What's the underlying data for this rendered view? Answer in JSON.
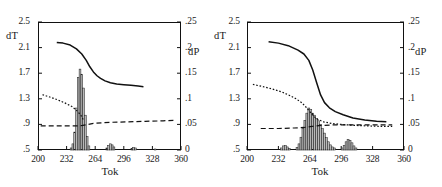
{
  "figure": {
    "panels": [
      {
        "id": "A",
        "tag": "(A)",
        "axis_left_label": "dT",
        "axis_right_label": "dP",
        "axis_x_label": "Tok"
      },
      {
        "id": "B",
        "tag": "(B)",
        "axis_left_label": "dT",
        "axis_right_label": "dP",
        "axis_x_label": "Tok"
      }
    ],
    "yticks_left": [
      "2.5",
      "2.1",
      "1.7",
      "1.3",
      ".9",
      ".5"
    ],
    "yticks_right": [
      ".25",
      ".2",
      ".15",
      ".1",
      ".05",
      "0"
    ],
    "xticks": [
      "200",
      "232",
      "264",
      "296",
      "328",
      "360"
    ]
  },
  "chart_data": [
    {
      "type": "line",
      "title": "(A)",
      "xlabel": "Tok",
      "ylabel": "dT",
      "y2label": "dP",
      "xlim": [
        200,
        360
      ],
      "ylim": [
        0.5,
        2.5
      ],
      "y2lim": [
        0,
        0.25
      ],
      "grid": false,
      "legend": "none",
      "xticks": [
        200,
        232,
        264,
        296,
        328,
        360
      ],
      "yticks": [
        0.5,
        0.9,
        1.3,
        1.7,
        2.1,
        2.5
      ],
      "y2ticks": [
        0,
        0.05,
        0.1,
        0.15,
        0.2,
        0.25
      ],
      "series": [
        {
          "name": "dT solid curve",
          "style": "solid",
          "axis": "left",
          "x": [
            221,
            228,
            236,
            243,
            249,
            254,
            258,
            262,
            266,
            270,
            275,
            281,
            288,
            296,
            304,
            312,
            318
          ],
          "y": [
            2.18,
            2.17,
            2.14,
            2.08,
            2.0,
            1.9,
            1.8,
            1.72,
            1.66,
            1.62,
            1.58,
            1.55,
            1.53,
            1.52,
            1.51,
            1.5,
            1.49
          ]
        },
        {
          "name": "dP dotted curve",
          "style": "dotted",
          "axis": "right",
          "x": [
            205,
            214,
            222,
            230,
            238,
            244,
            248,
            251
          ],
          "y": [
            0.108,
            0.103,
            0.098,
            0.092,
            0.085,
            0.076,
            0.068,
            0.058
          ]
        },
        {
          "name": "dP dashed baseline",
          "style": "dashed",
          "axis": "right",
          "x": [
            203,
            222,
            242,
            250,
            262,
            280,
            300,
            320,
            340,
            352
          ],
          "y": [
            0.047,
            0.047,
            0.047,
            0.048,
            0.052,
            0.054,
            0.055,
            0.056,
            0.057,
            0.058
          ]
        }
      ],
      "histogram": {
        "name": "dP histogram",
        "axis": "right",
        "bin_width": 2,
        "bins": [
          {
            "x": 237,
            "y": 0.004
          },
          {
            "x": 239,
            "y": 0.012
          },
          {
            "x": 241,
            "y": 0.035
          },
          {
            "x": 243,
            "y": 0.082
          },
          {
            "x": 245,
            "y": 0.142
          },
          {
            "x": 247,
            "y": 0.158
          },
          {
            "x": 249,
            "y": 0.148
          },
          {
            "x": 251,
            "y": 0.121
          },
          {
            "x": 253,
            "y": 0.068
          },
          {
            "x": 255,
            "y": 0.026
          },
          {
            "x": 257,
            "y": 0.008
          },
          {
            "x": 277,
            "y": 0.004
          },
          {
            "x": 279,
            "y": 0.009
          },
          {
            "x": 281,
            "y": 0.012
          },
          {
            "x": 283,
            "y": 0.01
          },
          {
            "x": 285,
            "y": 0.006
          },
          {
            "x": 305,
            "y": 0.003
          },
          {
            "x": 307,
            "y": 0.005
          },
          {
            "x": 309,
            "y": 0.004
          },
          {
            "x": 331,
            "y": 0.002
          }
        ]
      }
    },
    {
      "type": "line",
      "title": "(B)",
      "xlabel": "Tok",
      "ylabel": "dT",
      "y2label": "dP",
      "xlim": [
        200,
        360
      ],
      "ylim": [
        0.5,
        2.5
      ],
      "y2lim": [
        0,
        0.25
      ],
      "grid": false,
      "legend": "none",
      "xticks": [
        200,
        232,
        264,
        296,
        328,
        360
      ],
      "yticks": [
        0.5,
        0.9,
        1.3,
        1.7,
        2.1,
        2.5
      ],
      "y2ticks": [
        0,
        0.05,
        0.1,
        0.15,
        0.2,
        0.25
      ],
      "series": [
        {
          "name": "dT solid curve",
          "style": "solid",
          "axis": "left",
          "x": [
            222,
            232,
            242,
            252,
            258,
            263,
            267,
            271,
            275,
            279,
            284,
            290,
            298,
            308,
            320,
            332,
            342
          ],
          "y": [
            2.19,
            2.17,
            2.13,
            2.06,
            2.0,
            1.9,
            1.75,
            1.55,
            1.36,
            1.24,
            1.16,
            1.1,
            1.05,
            1.0,
            0.97,
            0.95,
            0.94
          ]
        },
        {
          "name": "dP dotted curve",
          "style": "dotted",
          "axis": "right",
          "x": [
            206,
            216,
            226,
            236,
            244,
            250,
            256,
            260,
            264,
            268,
            272,
            278,
            286,
            296,
            310,
            324,
            338,
            348
          ],
          "y": [
            0.128,
            0.124,
            0.119,
            0.113,
            0.106,
            0.1,
            0.092,
            0.084,
            0.075,
            0.066,
            0.06,
            0.055,
            0.052,
            0.05,
            0.048,
            0.047,
            0.046,
            0.046
          ]
        },
        {
          "name": "dP dashed baseline",
          "style": "dashed",
          "axis": "right",
          "x": [
            214,
            232,
            248,
            258,
            266,
            276,
            288,
            300,
            316,
            334,
            348
          ],
          "y": [
            0.042,
            0.042,
            0.043,
            0.044,
            0.046,
            0.048,
            0.049,
            0.049,
            0.049,
            0.049,
            0.049
          ]
        }
      ],
      "histogram": {
        "name": "dP histogram",
        "axis": "right",
        "bin_width": 2,
        "bins": [
          {
            "x": 235,
            "y": 0.004
          },
          {
            "x": 237,
            "y": 0.008
          },
          {
            "x": 239,
            "y": 0.009
          },
          {
            "x": 241,
            "y": 0.006
          },
          {
            "x": 243,
            "y": 0.003
          },
          {
            "x": 251,
            "y": 0.005
          },
          {
            "x": 253,
            "y": 0.012
          },
          {
            "x": 255,
            "y": 0.025
          },
          {
            "x": 257,
            "y": 0.042
          },
          {
            "x": 259,
            "y": 0.058
          },
          {
            "x": 261,
            "y": 0.072
          },
          {
            "x": 263,
            "y": 0.082
          },
          {
            "x": 265,
            "y": 0.079
          },
          {
            "x": 267,
            "y": 0.072
          },
          {
            "x": 269,
            "y": 0.068
          },
          {
            "x": 271,
            "y": 0.062
          },
          {
            "x": 273,
            "y": 0.057
          },
          {
            "x": 275,
            "y": 0.05
          },
          {
            "x": 277,
            "y": 0.042
          },
          {
            "x": 279,
            "y": 0.033
          },
          {
            "x": 281,
            "y": 0.024
          },
          {
            "x": 283,
            "y": 0.016
          },
          {
            "x": 285,
            "y": 0.01
          },
          {
            "x": 287,
            "y": 0.006
          },
          {
            "x": 289,
            "y": 0.004
          },
          {
            "x": 297,
            "y": 0.004
          },
          {
            "x": 299,
            "y": 0.009
          },
          {
            "x": 301,
            "y": 0.016
          },
          {
            "x": 303,
            "y": 0.021
          },
          {
            "x": 305,
            "y": 0.019
          },
          {
            "x": 307,
            "y": 0.014
          },
          {
            "x": 309,
            "y": 0.008
          },
          {
            "x": 311,
            "y": 0.004
          }
        ]
      }
    }
  ]
}
